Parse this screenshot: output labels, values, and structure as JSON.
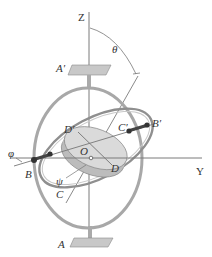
{
  "figure": {
    "labels": {
      "z_axis": "Z",
      "y_axis": "Y",
      "theta": "θ",
      "phi": "φ",
      "psi": "ψ",
      "origin": "O",
      "a_prime": "A′",
      "a": "A",
      "b": "B",
      "b_prime": "B′",
      "c": "C",
      "c_prime": "C′",
      "d": "D",
      "d_prime": "D′"
    },
    "colors": {
      "line": "#6e6e6e",
      "ring": "#9a9a9a",
      "ring_light": "#bdbdbd",
      "disk_top": "#d9d9d9",
      "disk_side": "#c4c4c4",
      "plate": "#b8b8b8",
      "shaft": "#444444",
      "text": "#333333"
    }
  }
}
